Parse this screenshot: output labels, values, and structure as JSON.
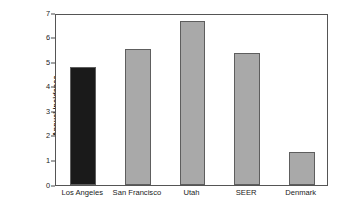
{
  "chart_data": {
    "type": "bar",
    "title": "",
    "subtitle": "",
    "xlabel": "",
    "ylabel": "Annual incidence (per 100,000)",
    "ylabel_line1": "Annual incidence",
    "ylabel_line2": "(per 100,000)",
    "categories": [
      "Los Angeles",
      "San Francisco",
      "Utah",
      "SEER",
      "Denmark"
    ],
    "values": [
      4.8,
      5.5,
      6.65,
      5.35,
      1.33
    ],
    "ylim": [
      0,
      7
    ],
    "ytick_values": [
      0,
      1,
      2,
      3,
      4,
      5,
      6,
      7
    ],
    "ytick_labels": [
      "0",
      "1",
      "2",
      "3",
      "4",
      "5",
      "6",
      "7"
    ],
    "grid": false,
    "legend": "none",
    "bar_colors": [
      "#1a1a1a",
      "#a9a9a9",
      "#a9a9a9",
      "#a9a9a9",
      "#a9a9a9"
    ],
    "bar_edge_color": "#5e5e5e",
    "frame_color": "#555555",
    "background_color": "#ffffff",
    "bars": [
      {
        "category": "Los Angeles",
        "value": 4.8,
        "color": "#1a1a1a",
        "highlighted": true
      },
      {
        "category": "San Francisco",
        "value": 5.5,
        "color": "#a9a9a9",
        "highlighted": false
      },
      {
        "category": "Utah",
        "value": 6.65,
        "color": "#a9a9a9",
        "highlighted": false
      },
      {
        "category": "SEER",
        "value": 5.35,
        "color": "#a9a9a9",
        "highlighted": false
      },
      {
        "category": "Denmark",
        "value": 1.33,
        "color": "#a9a9a9",
        "highlighted": false
      }
    ]
  }
}
